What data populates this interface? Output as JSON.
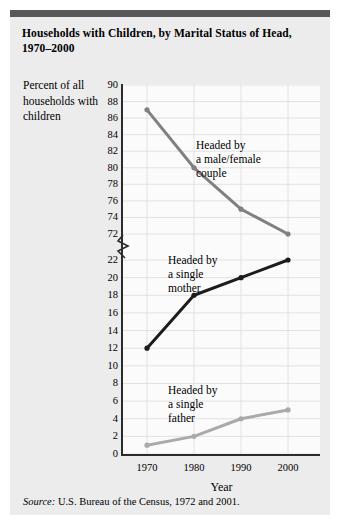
{
  "figure": {
    "title": "Households with Children, by Marital Status of Head, 1970–2000",
    "y_caption": "Percent\nof all\nhouseholds\nwith\nchildren",
    "x_label": "Year",
    "source_word": "Source:",
    "source_text": " U.S. Bureau of the Census, 1972 and 2001.",
    "colors": {
      "panel_background": "#ececed",
      "plot_background": "#fbfbfb",
      "top_rule": "#58585a",
      "axis": "#2c2c2c",
      "grid": "#e2e2e4",
      "series_couple": "#808082",
      "series_mother": "#1c1c1c",
      "series_father": "#aaaaac"
    }
  },
  "chart_data": {
    "type": "line",
    "title": "Households with Children, by Marital Status of Head, 1970–2000",
    "xlabel": "Year",
    "ylabel": "Percent of all households with children",
    "x": [
      1970,
      1980,
      1990,
      2000
    ],
    "xtick_labels": [
      "1970",
      "1980",
      "1990",
      "2000"
    ],
    "ytick_labels_upper": [
      "90",
      "88",
      "86",
      "84",
      "82",
      "80",
      "78",
      "76",
      "74",
      "72"
    ],
    "ytick_values_upper": [
      90,
      88,
      86,
      84,
      82,
      80,
      78,
      76,
      74,
      72
    ],
    "ytick_labels_lower": [
      "22",
      "20",
      "18",
      "16",
      "14",
      "12",
      "10",
      "8",
      "6",
      "4",
      "2",
      "0"
    ],
    "ytick_values_lower": [
      22,
      20,
      18,
      16,
      14,
      12,
      10,
      8,
      6,
      4,
      2,
      0
    ],
    "axis_break": true,
    "axis_break_between": [
      72,
      22
    ],
    "grid": true,
    "legend_position": "inline-annotations",
    "series": [
      {
        "name": "Headed by a male/female couple",
        "annotation": "Headed by\na male/female\ncouple",
        "color": "#808082",
        "values": [
          87,
          80,
          75,
          72
        ]
      },
      {
        "name": "Headed by a single mother",
        "annotation": "Headed by\na single\nmother",
        "color": "#1c1c1c",
        "values": [
          12,
          18,
          20,
          22
        ]
      },
      {
        "name": "Headed by a single father",
        "annotation": "Headed by\na single\nfather",
        "color": "#aaaaac",
        "values": [
          1,
          2,
          4,
          5
        ]
      }
    ]
  }
}
